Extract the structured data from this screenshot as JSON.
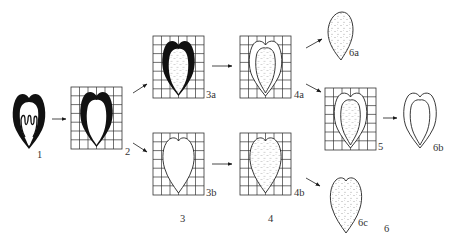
{
  "diagram": {
    "type": "process-flow",
    "stages": [
      {
        "id": "1",
        "label": "1",
        "description": "intact seed with folded inner tissue"
      },
      {
        "id": "2",
        "label": "2",
        "description": "seed on grid, dark coat, hollow interior"
      },
      {
        "id": "3",
        "label": "3",
        "variants": [
          {
            "id": "3a",
            "label": "3a",
            "description": "grid, dark coat with stippled interior"
          },
          {
            "id": "3b",
            "label": "3b",
            "description": "grid, heart-shaped outline, empty"
          }
        ]
      },
      {
        "id": "4",
        "label": "4",
        "variants": [
          {
            "id": "4a",
            "label": "4a",
            "description": "grid, outlined coat with stippled interior"
          },
          {
            "id": "4b",
            "label": "4b",
            "description": "grid, heart-shaped stippled"
          }
        ]
      },
      {
        "id": "5",
        "label": "5",
        "description": "grid, outlined coat with stippled interior"
      },
      {
        "id": "6",
        "label": "6",
        "variants": [
          {
            "id": "6a",
            "label": "6a",
            "description": "stippled teardrop, no grid"
          },
          {
            "id": "6b",
            "label": "6b",
            "description": "double-outlined empty coat, no grid"
          },
          {
            "id": "6c",
            "label": "6c",
            "description": "stippled heart shape, no grid"
          }
        ]
      }
    ],
    "edges": [
      {
        "from": "1",
        "to": "2"
      },
      {
        "from": "2",
        "to": "3a"
      },
      {
        "from": "2",
        "to": "3b"
      },
      {
        "from": "3a",
        "to": "4a"
      },
      {
        "from": "3b",
        "to": "4b"
      },
      {
        "from": "4a",
        "to": "6a"
      },
      {
        "from": "4a",
        "to": "5"
      },
      {
        "from": "5",
        "to": "6b"
      },
      {
        "from": "4b",
        "to": "6c"
      }
    ]
  },
  "labels": {
    "l1": "1",
    "l2": "2",
    "l3a": "3a",
    "l3b": "3b",
    "l3": "3",
    "l4a": "4a",
    "l4b": "4b",
    "l4": "4",
    "l5": "5",
    "l6a": "6a",
    "l6b": "6b",
    "l6c": "6c",
    "l6": "6"
  },
  "colors": {
    "ink": "#1a1a1a",
    "grid": "#333333",
    "background": "#ffffff"
  }
}
